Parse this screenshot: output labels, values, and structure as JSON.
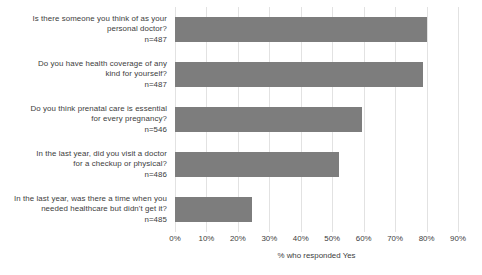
{
  "chart_data": {
    "type": "bar",
    "orientation": "horizontal",
    "title": "",
    "xlabel": "% who responded Yes",
    "ylabel": "",
    "xlim": [
      0,
      90
    ],
    "xticks": [
      "0%",
      "10%",
      "20%",
      "30%",
      "40%",
      "50%",
      "60%",
      "70%",
      "80%",
      "90%"
    ],
    "xtick_values": [
      0,
      10,
      20,
      30,
      40,
      50,
      60,
      70,
      80,
      90
    ],
    "grid": true,
    "legend": "none",
    "bar_color": "#7d7d7d",
    "categories": [
      "Is there someone you think of as your personal doctor? n=487",
      "Do you have health coverage of any kind for yourself? n=487",
      "Do you think prenatal care is essential for every pregnancy? n=546",
      "In the last year, did you visit a doctor for a checkup or physical? n=486",
      "In the last year, was there a time when you needed healthcare but didn't get it? n=485"
    ],
    "values": [
      80,
      78.8,
      59.5,
      52,
      24.5
    ],
    "bars": [
      {
        "line1": "Is there someone you think of as your",
        "line2": "personal doctor?",
        "n": "n=487",
        "value": 80
      },
      {
        "line1": "Do you have health coverage of any",
        "line2": "kind for yourself?",
        "n": "n=487",
        "value": 78.8
      },
      {
        "line1": "Do you think prenatal care is essential",
        "line2": "for every pregnancy?",
        "n": "n=546",
        "value": 59.5
      },
      {
        "line1": "In the last year, did you visit a doctor",
        "line2": "for a checkup or physical?",
        "n": "n=486",
        "value": 52
      },
      {
        "line1": "In the last year, was there a time when you",
        "line2": "needed healthcare but didn't get it?",
        "n": "n=485",
        "value": 24.5
      }
    ]
  }
}
